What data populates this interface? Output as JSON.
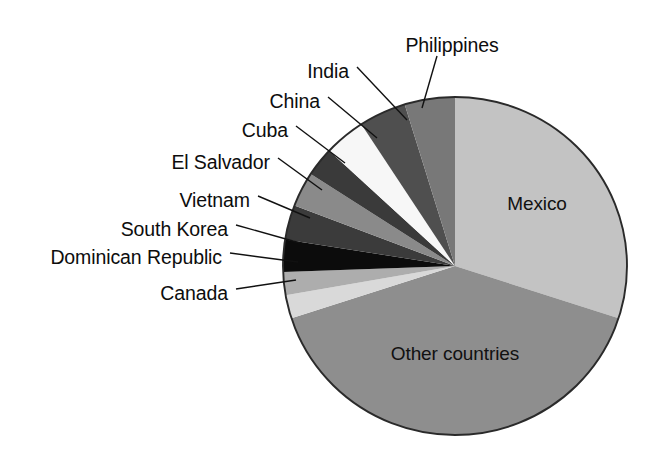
{
  "figure": {
    "background_color": "#ffffff",
    "width": 671,
    "height": 462
  },
  "chart_data": {
    "type": "pie",
    "title": "",
    "subtitle": "",
    "xlabel": "",
    "ylabel": "",
    "legend_position": "none",
    "grid": false,
    "label_style": "external leader lines plus internal labels",
    "start_angle_deg_from_12oclock": 0,
    "direction": "clockwise",
    "categories": [
      "Mexico",
      "Other countries",
      "Canada",
      "Dominican Republic",
      "South Korea",
      "Vietnam",
      "El Salvador",
      "Cuba",
      "China",
      "India",
      "Philippines"
    ],
    "values": [
      30.0,
      40.0,
      2.2,
      2.2,
      3.1,
      3.3,
      3.3,
      2.8,
      3.9,
      4.4,
      4.8
    ],
    "slices": [
      {
        "label": "Mexico",
        "value": 30.0,
        "start_deg": 0.0,
        "end_deg": 108.0,
        "color": "#c3c3c3",
        "label_placement": "inside",
        "label_x": 537,
        "label_y": 205
      },
      {
        "label": "Other countries",
        "value": 40.0,
        "start_deg": 108.0,
        "end_deg": 252.0,
        "color": "#8e8e8e",
        "label_placement": "inside",
        "label_x": 455,
        "label_y": 355
      },
      {
        "label": "Canada",
        "value": 2.2,
        "start_deg": 252.0,
        "end_deg": 260.0,
        "color": "#d9d9d9",
        "label_placement": "leader",
        "label_x": 228,
        "label_y": 295,
        "label_anchor": "end",
        "leader": [
          [
            236,
            289
          ],
          [
            296,
            280
          ]
        ]
      },
      {
        "label": "Dominican Republic",
        "value": 2.2,
        "start_deg": 260.0,
        "end_deg": 268.0,
        "color": "#adadad",
        "label_placement": "leader",
        "label_x": 222,
        "label_y": 259,
        "label_anchor": "end",
        "leader": [
          [
            230,
            253
          ],
          [
            298,
            262
          ]
        ]
      },
      {
        "label": "South Korea",
        "value": 3.1,
        "start_deg": 268.0,
        "end_deg": 279.0,
        "color": "#0c0c0c",
        "label_placement": "leader",
        "label_x": 228,
        "label_y": 231,
        "label_anchor": "end",
        "leader": [
          [
            236,
            225
          ],
          [
            300,
            243
          ]
        ]
      },
      {
        "label": "Vietnam",
        "value": 3.3,
        "start_deg": 279.0,
        "end_deg": 291.0,
        "color": "#3b3b3b",
        "label_placement": "leader",
        "label_x": 250,
        "label_y": 202,
        "label_anchor": "end",
        "leader": [
          [
            258,
            196
          ],
          [
            310,
            218
          ]
        ]
      },
      {
        "label": "El Salvador",
        "value": 3.3,
        "start_deg": 291.0,
        "end_deg": 303.0,
        "color": "#8a8a8a",
        "label_placement": "leader",
        "label_x": 270,
        "label_y": 164,
        "label_anchor": "end",
        "leader": [
          [
            278,
            158
          ],
          [
            322,
            190
          ]
        ]
      },
      {
        "label": "Cuba",
        "value": 2.8,
        "start_deg": 303.0,
        "end_deg": 313.0,
        "color": "#3a3a3a",
        "label_placement": "leader",
        "label_x": 288,
        "label_y": 132,
        "label_anchor": "end",
        "leader": [
          [
            296,
            126
          ],
          [
            345,
            163
          ]
        ]
      },
      {
        "label": "China",
        "value": 3.9,
        "start_deg": 313.0,
        "end_deg": 327.0,
        "color": "#f7f7f7",
        "label_placement": "leader",
        "label_x": 320,
        "label_y": 103,
        "label_anchor": "end",
        "leader": [
          [
            328,
            97
          ],
          [
            377,
            138
          ]
        ]
      },
      {
        "label": "India",
        "value": 4.4,
        "start_deg": 327.0,
        "end_deg": 343.0,
        "color": "#4f4f4f",
        "label_placement": "leader",
        "label_x": 349,
        "label_y": 73,
        "label_anchor": "end",
        "leader": [
          [
            357,
            67
          ],
          [
            407,
            120
          ]
        ]
      },
      {
        "label": "Philippines",
        "value": 4.8,
        "start_deg": 343.0,
        "end_deg": 360.0,
        "color": "#787878",
        "label_placement": "leader",
        "label_x": 452,
        "label_y": 47,
        "label_anchor": "middle",
        "leader": [
          [
            437,
            56
          ],
          [
            422,
            108
          ]
        ]
      }
    ],
    "geometry": {
      "center_x": 455,
      "center_y": 266,
      "radius_x": 172,
      "radius_y": 169,
      "outline_color": "#2a2a2a"
    }
  },
  "labels": {
    "mexico": "Mexico",
    "other_countries": "Other countries",
    "canada": "Canada",
    "dominican_republic": "Dominican Republic",
    "south_korea": "South Korea",
    "vietnam": "Vietnam",
    "el_salvador": "El Salvador",
    "cuba": "Cuba",
    "china": "China",
    "india": "India",
    "philippines": "Philippines"
  }
}
